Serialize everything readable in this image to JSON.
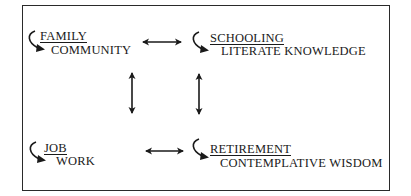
{
  "diagram": {
    "nodes": [
      {
        "id": "family",
        "top_label": "FAMILY",
        "bottom_label": "COMMUNITY"
      },
      {
        "id": "schooling",
        "top_label": "SCHOOLING",
        "bottom_label": "LITERATE KNOWLEDGE"
      },
      {
        "id": "job",
        "top_label": "JOB",
        "bottom_label": "WORK"
      },
      {
        "id": "retirement",
        "top_label": "RETIREMENT",
        "bottom_label": "CONTEMPLATIVE WISDOM"
      }
    ],
    "edges": [
      {
        "from": "family",
        "to": "schooling",
        "type": "bidirectional"
      },
      {
        "from": "job",
        "to": "retirement",
        "type": "bidirectional"
      },
      {
        "from": "family",
        "to": "job",
        "type": "bidirectional"
      },
      {
        "from": "schooling",
        "to": "retirement",
        "type": "bidirectional"
      }
    ],
    "icons": {
      "node_curve": "curved-arrow-icon",
      "edge": "double-arrow-icon"
    },
    "colors": {
      "ink": "#1a1a1a",
      "frame": "#2a2a2a",
      "background": "#ffffff"
    }
  }
}
